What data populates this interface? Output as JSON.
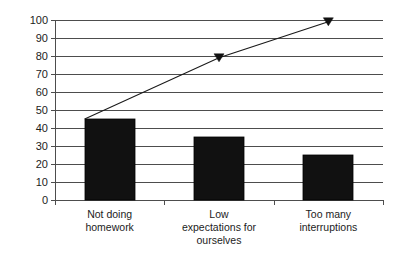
{
  "chart_data": {
    "type": "bar",
    "title": "",
    "subtitle": "",
    "xlabel": "",
    "ylabel": "",
    "categories": [
      "Not doing homework",
      "Low expectations for ourselves",
      "Too many interruptions"
    ],
    "category_lines": [
      [
        "Not doing",
        "homework"
      ],
      [
        "Low",
        "expectations for",
        "ourselves"
      ],
      [
        "Too many",
        "interruptions"
      ]
    ],
    "values": [
      45,
      35,
      25
    ],
    "series": [
      {
        "name": "Count",
        "type": "bar",
        "values": [
          45,
          35,
          25
        ]
      },
      {
        "name": "Cumulative",
        "type": "line",
        "values": [
          45,
          79,
          99
        ]
      }
    ],
    "ylim": [
      0,
      100
    ],
    "ytick_step": 10,
    "yticks": [
      100,
      90,
      80,
      70,
      60,
      50,
      40,
      30,
      20,
      10,
      0
    ],
    "ytick_labels": [
      "100",
      "90",
      "80",
      "70",
      "60",
      "50",
      "40",
      "30",
      "20",
      "10",
      "0"
    ],
    "grid": true,
    "legend": "none",
    "line_marker": "triangle-down",
    "colors": {
      "bar_fill": "#111111",
      "bar_stroke": "#000000",
      "grid": "#4d4d4d",
      "axis": "#4d4d4d",
      "line": "#1a1a1a",
      "marker": "#111111",
      "text": "#1c1c1c",
      "background": "#ffffff"
    }
  }
}
